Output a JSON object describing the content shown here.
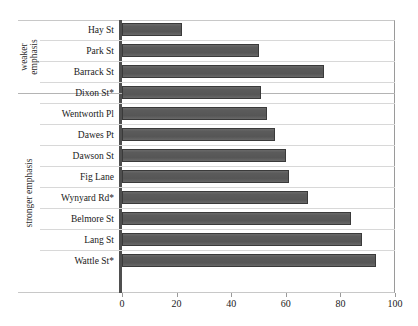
{
  "chart": {
    "title_remnant": "",
    "axis": {
      "x_ticks": [
        "0",
        "20",
        "40",
        "60",
        "80",
        "100"
      ],
      "x_min": 0,
      "x_max": 100
    },
    "groups": [
      {
        "id": "weaker",
        "label": "weaker emphasis"
      },
      {
        "id": "stronger",
        "label": "stronger emphasis"
      }
    ]
  },
  "chart_data": {
    "type": "bar",
    "orientation": "horizontal",
    "title": "",
    "xlabel": "",
    "ylabel": "",
    "xlim": [
      0,
      100
    ],
    "grid": true,
    "legend": "none",
    "categories": [
      "Hay St",
      "Park St",
      "Barrack St",
      "Dixon St*",
      "Wentworth Pl",
      "Dawes Pt",
      "Dawson St",
      "Fig Lane",
      "Wynyard Rd*",
      "Belmore St",
      "Lang St",
      "Wattle St*"
    ],
    "values": [
      22,
      50,
      74,
      51,
      53,
      56,
      60,
      61,
      68,
      84,
      88,
      93
    ],
    "group_assignment": [
      "weaker",
      "weaker",
      "weaker",
      "stronger",
      "stronger",
      "stronger",
      "stronger",
      "stronger",
      "stronger",
      "stronger",
      "stronger",
      "stronger"
    ],
    "x_ticks": [
      0,
      20,
      40,
      60,
      80,
      100
    ],
    "bar_color": "#5b5b5b",
    "bar_edge_color": "#3a3a3a"
  }
}
